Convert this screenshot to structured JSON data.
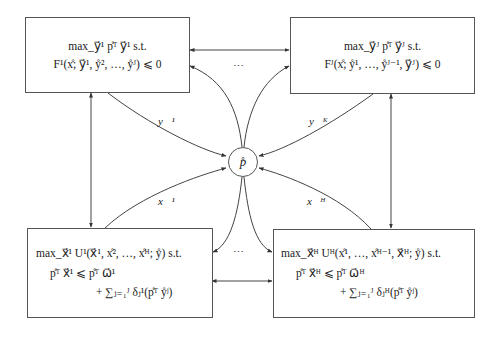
{
  "diagram": {
    "center_node": {
      "label": "p̊"
    },
    "boxes": {
      "top_left": {
        "line1": "max_y⃗¹ p̊ᵀ y⃗¹ s.t.",
        "line2": "F¹(x̊; y⃗¹, ẙ², …, ẙᴶ) ⩽ 0"
      },
      "top_right": {
        "line1": "max_y⃗ᴶ p̊ᵀ y⃗ᴶ s.t.",
        "line2": "Fᴶ(x̊; ẙ¹, …, ẙᴶ⁻¹, y⃗ᴶ) ⩽ 0"
      },
      "bottom_left": {
        "line1": "max_x⃗¹ U¹(x⃗¹, x̊², …, x̊ᴴ; ẙ) s.t.",
        "line2": "p̊ᵀ x⃗¹ ⩽ p̊ᵀ ω⃗¹",
        "line3": "+ ∑ⱼ₌₁ᴶ δⱼ¹(p̊ᵀ ẙʲ)"
      },
      "bottom_right": {
        "line1": "max_x⃗ᴴ Uᴴ(x̊¹, …, x̊ᴴ⁻¹, x⃗ᴴ; ẙ) s.t.",
        "line2": "p̊ᵀ x⃗ᴴ ⩽ p̊ᵀ ω⃗ᴴ",
        "line3": "+ ∑ⱼ₌₁ᴶ δⱼᴴ(p̊ᵀ ẙʲ)"
      }
    },
    "edge_labels": {
      "y1": "y⃗¹",
      "yK": "y⃗ᴷ",
      "x1": "x⃗¹",
      "xH": "x⃗ᴴ"
    },
    "ellipsis_top": "⋯",
    "ellipsis_bottom": "⋯"
  }
}
